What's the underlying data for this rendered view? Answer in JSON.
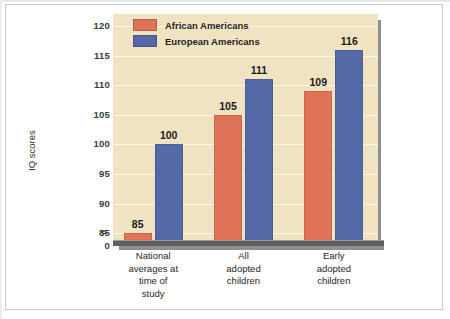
{
  "figure": {
    "background_color": "#ffffff",
    "border_color": "#c9c9c9"
  },
  "chart_data": {
    "type": "bar",
    "title": "",
    "subtitle": "",
    "xlabel": "",
    "ylabel": "IQ scores",
    "ylim": [
      0,
      122
    ],
    "y_axis_break": true,
    "y_axis_break_symbol": "≈",
    "grid": true,
    "grid_axis": "y",
    "legend_position": "top-left-inside",
    "categories": [
      "National averages at time of study",
      "All adopted children",
      "Early adopted children"
    ],
    "category_lines": [
      [
        "National",
        "averages at",
        "time of",
        "study"
      ],
      [
        "All",
        "adopted",
        "children"
      ],
      [
        "Early",
        "adopted",
        "children"
      ]
    ],
    "yticks": [
      0,
      85,
      90,
      95,
      100,
      105,
      110,
      115,
      120
    ],
    "ytick_labels": [
      "0",
      "85",
      "90",
      "95",
      "100",
      "105",
      "110",
      "115",
      "120"
    ],
    "series": [
      {
        "name": "African Americans",
        "color": "#e07258",
        "values": [
          85,
          105,
          109
        ],
        "value_labels": [
          "85",
          "105",
          "109"
        ]
      },
      {
        "name": "European Americans",
        "color": "#5569a8",
        "values": [
          100,
          111,
          116
        ],
        "value_labels": [
          "100",
          "111",
          "116"
        ]
      }
    ]
  },
  "plot": {
    "background_color": "#f0e3c2",
    "gridline_color": "#fdf8ec",
    "shadow_color": "#8e8e8e",
    "axis_color": "#5e5e5e"
  },
  "legend": {
    "items": [
      {
        "label": "African Americans",
        "color": "#e07258",
        "swatch_name": "legend-swatch-african-americans"
      },
      {
        "label": "European Americans",
        "color": "#5569a8",
        "swatch_name": "legend-swatch-european-americans"
      }
    ]
  }
}
